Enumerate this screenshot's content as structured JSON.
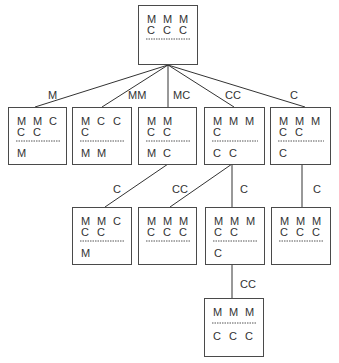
{
  "diagram": {
    "title": "",
    "colors": {
      "stroke": "#4a4a4a",
      "text": "#333333",
      "background": "#ffffff"
    },
    "nodes": [
      {
        "id": "root",
        "x": 138,
        "y": 5,
        "w": 59,
        "h": 59,
        "rows_top": [
          [
            "M",
            "M",
            "M"
          ],
          [
            "C",
            "C",
            "C"
          ]
        ],
        "rows_bottom": []
      },
      {
        "id": "n1",
        "x": 8,
        "y": 107,
        "w": 58,
        "h": 57,
        "rows_top": [
          [
            "M",
            "M",
            "C"
          ],
          [
            "C",
            "C",
            ""
          ]
        ],
        "rows_bottom": [
          [
            "M",
            "",
            ""
          ]
        ]
      },
      {
        "id": "n2",
        "x": 72,
        "y": 107,
        "w": 59,
        "h": 57,
        "rows_top": [
          [
            "M",
            "C",
            "C"
          ],
          [
            "C",
            "",
            ""
          ]
        ],
        "rows_bottom": [
          [
            "M",
            "M",
            ""
          ]
        ]
      },
      {
        "id": "n3",
        "x": 138,
        "y": 107,
        "w": 58,
        "h": 57,
        "rows_top": [
          [
            "M",
            "M",
            ""
          ],
          [
            "C",
            "C",
            ""
          ]
        ],
        "rows_bottom": [
          [
            "M",
            "C",
            ""
          ]
        ]
      },
      {
        "id": "n4",
        "x": 204,
        "y": 107,
        "w": 60,
        "h": 57,
        "rows_top": [
          [
            "M",
            "M",
            "M"
          ],
          [
            "C",
            "",
            ""
          ]
        ],
        "rows_bottom": [
          [
            "C",
            "C",
            ""
          ]
        ]
      },
      {
        "id": "n5",
        "x": 270,
        "y": 107,
        "w": 60,
        "h": 57,
        "rows_top": [
          [
            "M",
            "M",
            "M"
          ],
          [
            "C",
            "C",
            ""
          ]
        ],
        "rows_bottom": [
          [
            "C",
            "",
            ""
          ]
        ]
      },
      {
        "id": "n6",
        "x": 72,
        "y": 207,
        "w": 59,
        "h": 57,
        "rows_top": [
          [
            "M",
            "M",
            "C"
          ],
          [
            "C",
            "C",
            ""
          ]
        ],
        "rows_bottom": [
          [
            "M",
            "",
            ""
          ]
        ]
      },
      {
        "id": "n7",
        "x": 138,
        "y": 207,
        "w": 58,
        "h": 57,
        "rows_top": [
          [
            "M",
            "M",
            "M"
          ],
          [
            "C",
            "C",
            "C"
          ]
        ],
        "rows_bottom": []
      },
      {
        "id": "n8",
        "x": 205,
        "y": 207,
        "w": 59,
        "h": 57,
        "rows_top": [
          [
            "M",
            "M",
            "M"
          ],
          [
            "C",
            "C",
            ""
          ]
        ],
        "rows_bottom": [
          [
            "C",
            "",
            ""
          ]
        ]
      },
      {
        "id": "n9",
        "x": 271,
        "y": 207,
        "w": 59,
        "h": 57,
        "rows_top": [
          [
            "M",
            "M",
            "M"
          ],
          [
            "C",
            "C",
            "C"
          ]
        ],
        "rows_bottom": []
      },
      {
        "id": "n10",
        "x": 204,
        "y": 298,
        "w": 59,
        "h": 58,
        "rows_top": [
          [
            "M",
            "M",
            "M"
          ]
        ],
        "rows_bottom": [
          [
            "C",
            "C",
            "C"
          ]
        ]
      }
    ],
    "edges": [
      {
        "from": "root",
        "to": "n1",
        "x1": 168,
        "y1": 65,
        "x2": 35,
        "y2": 107,
        "label": "M",
        "lx": 48,
        "ly": 99
      },
      {
        "from": "root",
        "to": "n2",
        "x1": 168,
        "y1": 65,
        "x2": 102,
        "y2": 107,
        "label": "MM",
        "lx": 128,
        "ly": 99
      },
      {
        "from": "root",
        "to": "n3",
        "x1": 168,
        "y1": 65,
        "x2": 168,
        "y2": 107,
        "label": "MC",
        "lx": 173,
        "ly": 99
      },
      {
        "from": "root",
        "to": "n4",
        "x1": 168,
        "y1": 65,
        "x2": 234,
        "y2": 107,
        "label": "CC",
        "lx": 225,
        "ly": 99
      },
      {
        "from": "root",
        "to": "n5",
        "x1": 168,
        "y1": 65,
        "x2": 305,
        "y2": 107,
        "label": "C",
        "lx": 290,
        "ly": 99
      },
      {
        "from": "n3",
        "to": "n6",
        "x1": 168,
        "y1": 164,
        "x2": 105,
        "y2": 207,
        "label": "C",
        "lx": 113,
        "ly": 193
      },
      {
        "from": "n4",
        "to": "n7",
        "x1": 232,
        "y1": 164,
        "x2": 170,
        "y2": 207,
        "label": "CC",
        "lx": 172,
        "ly": 193
      },
      {
        "from": "n4",
        "to": "n8",
        "x1": 232,
        "y1": 164,
        "x2": 232,
        "y2": 207,
        "label": "C",
        "lx": 240,
        "ly": 193
      },
      {
        "from": "n5",
        "to": "n9",
        "x1": 302,
        "y1": 164,
        "x2": 302,
        "y2": 207,
        "label": "C",
        "lx": 313,
        "ly": 193
      },
      {
        "from": "n8",
        "to": "n10",
        "x1": 232,
        "y1": 264,
        "x2": 232,
        "y2": 298,
        "label": "CC",
        "lx": 240,
        "ly": 288
      }
    ]
  }
}
